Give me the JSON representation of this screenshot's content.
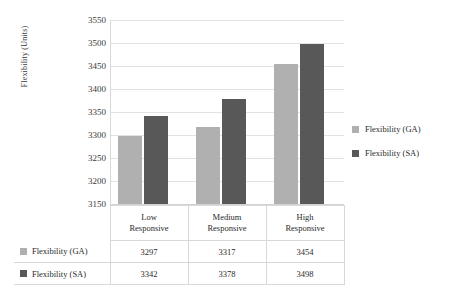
{
  "chart_data": {
    "type": "bar",
    "title": "",
    "xlabel": "",
    "ylabel": "Flexibility (Units)",
    "categories": [
      "Low Responsive",
      "Medium Responsive",
      "High Responsive"
    ],
    "category_lines": [
      [
        "Low",
        "Responsive"
      ],
      [
        "Medium",
        "Responsive"
      ],
      [
        "High",
        "Responsive"
      ]
    ],
    "series": [
      {
        "name": "Flexibility (GA)",
        "color": "#b0b0b0",
        "values": [
          3297,
          3317,
          3454
        ]
      },
      {
        "name": "Flexibility (SA)",
        "color": "#585858",
        "values": [
          3342,
          3378,
          3498
        ]
      }
    ],
    "ylim": [
      3150,
      3550
    ],
    "ytick_step": 50,
    "yticks": [
      "3550",
      "3500",
      "3450",
      "3400",
      "3350",
      "3300",
      "3250",
      "3200",
      "3150"
    ],
    "grid": true,
    "legend_position": "right",
    "data_table": {
      "visible": true,
      "column_headers": [
        "Low Responsive",
        "Medium Responsive",
        "High Responsive"
      ],
      "rows": [
        {
          "label": "Flexibility (GA)",
          "color": "#b0b0b0",
          "values": [
            "3297",
            "3317",
            "3454"
          ]
        },
        {
          "label": "Flexibility (SA)",
          "color": "#585858",
          "values": [
            "3342",
            "3378",
            "3498"
          ]
        }
      ]
    }
  },
  "legend": {
    "items": [
      {
        "label": "Flexibility (GA)"
      },
      {
        "label": "Flexibility (SA)"
      }
    ]
  }
}
